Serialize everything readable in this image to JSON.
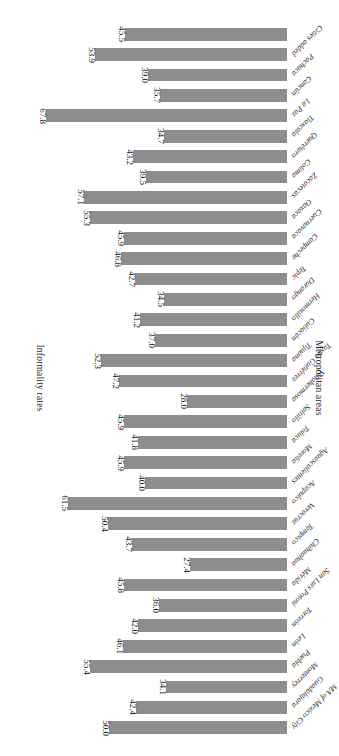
{
  "chart_data": {
    "type": "bar",
    "orientation": "horizontal",
    "title": "",
    "xlabel": "Informality rates",
    "ylabel": "Metropolitan areas",
    "grid": false,
    "legend": null,
    "xlim": [
      0,
      70
    ],
    "bar_color": "#8d8d8d",
    "value_label_format": "one-decimal",
    "categories": [
      "MA of Mexico City",
      "Guadalajara",
      "Monterrey",
      "Puebla",
      "León",
      "Torreón",
      "San Luis Potosí",
      "Mérida",
      "Chihuahua",
      "Tampico",
      "Veracruz",
      "Acapulco",
      "Aguascalientes",
      "Morelia",
      "Toluca",
      "Saltillo",
      "Villahermosa",
      "Tuxtla Gutiérrez",
      "Tijuana",
      "Culiacán",
      "Hermosillo",
      "Durango",
      "Tepic",
      "Campeche",
      "Cuernavaca",
      "Oaxaca",
      "Zacatecas",
      "Colima",
      "Querétaro",
      "Tlaxcala",
      "La Paz",
      "Cancún",
      "Pachuca",
      "Cities added"
    ],
    "values": [
      50.0,
      42.4,
      34.1,
      55.4,
      46.1,
      42.0,
      36.0,
      45.8,
      27.4,
      43.7,
      50.4,
      61.5,
      40.0,
      45.9,
      41.8,
      45.9,
      28.0,
      47.2,
      52.3,
      37.0,
      41.2,
      34.5,
      42.7,
      46.8,
      45.9,
      55.3,
      57.1,
      39.5,
      43.2,
      34.7,
      67.8,
      35.7,
      39.0,
      53.9
    ],
    "extra_top_bar": {
      "label": "",
      "value": 45.5
    }
  },
  "axes": {
    "x_title": "Informality rates",
    "y_title": "Metropolitan areas"
  }
}
